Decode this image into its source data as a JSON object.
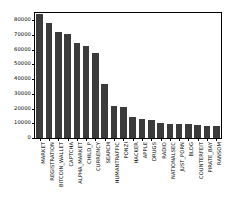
{
  "chart_data": {
    "type": "bar",
    "title": "",
    "xlabel": "",
    "ylabel": "",
    "ylim": [
      0,
      85000
    ],
    "grid": false,
    "legend": false,
    "bar_color": "#3b3b3b",
    "axes_color": "#000000",
    "background": "#ffffff",
    "label_rotation": 90,
    "ytick_labels": [
      "0",
      "10000",
      "20000",
      "30000",
      "40000",
      "50000",
      "60000",
      "70000",
      "80000"
    ],
    "ytick_values": [
      0,
      10000,
      20000,
      30000,
      40000,
      50000,
      60000,
      70000,
      80000
    ],
    "categories": [
      "MARKET",
      "REGISTRATION",
      "BITCOIN_WALLET",
      "CAPTCHA",
      "ALPHA_MARKET",
      "CHILD_P",
      "CURRENCY",
      "SEARCH",
      "HUMANTRAFFIC",
      "PONZI",
      "HACKER",
      "APPLE",
      "DRUGS",
      "RADIO",
      "NATIONALSEC",
      "JUST_PORN",
      "BLOG",
      "COUNTERFEIT",
      "PIRATE_BAY",
      "RANSOM"
    ],
    "values": [
      84000,
      78000,
      72000,
      71000,
      64500,
      62500,
      57500,
      37000,
      22000,
      21000,
      14500,
      12800,
      12000,
      10500,
      9500,
      9400,
      9400,
      8800,
      8300,
      8200
    ]
  }
}
